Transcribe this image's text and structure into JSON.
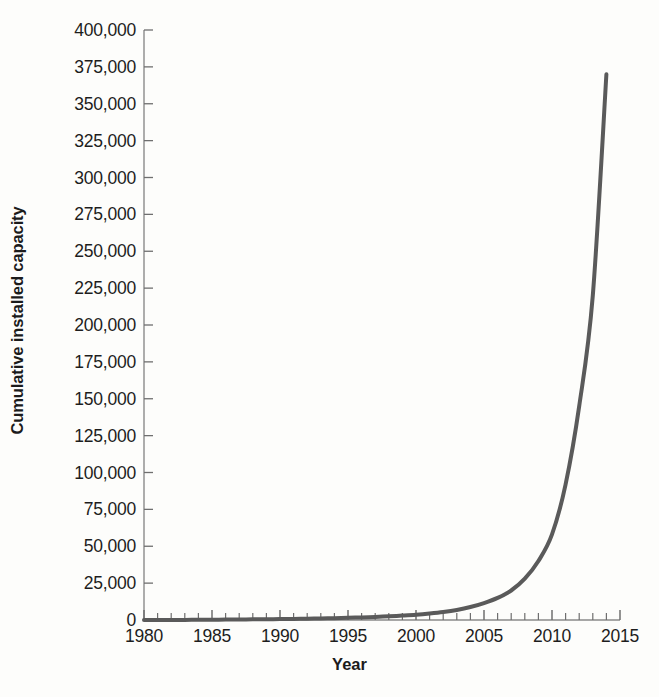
{
  "chart_data": {
    "type": "line",
    "title": "",
    "subtitle": "",
    "xlabel": "Year",
    "ylabel": "Cumulative installed capacity",
    "xlim": [
      1980,
      2015
    ],
    "ylim": [
      0,
      400000
    ],
    "grid": false,
    "legend": null,
    "legend_position": "none",
    "x_tick_labels": [
      "1980",
      "1985",
      "1990",
      "1995",
      "2000",
      "2005",
      "2010",
      "2015"
    ],
    "x_tick_values": [
      1980,
      1985,
      1990,
      1995,
      2000,
      2005,
      2010,
      2015
    ],
    "x_minor_tick_interval": 1,
    "y_tick_labels": [
      "400,000",
      "375,000",
      "350,000",
      "325,000",
      "300,000",
      "275,000",
      "250,000",
      "225,000",
      "200,000",
      "175,000",
      "150,000",
      "125,000",
      "100,000",
      "75,000",
      "50,000",
      "25,000",
      "0"
    ],
    "y_tick_values": [
      400000,
      375000,
      350000,
      325000,
      300000,
      275000,
      250000,
      225000,
      200000,
      175000,
      150000,
      125000,
      100000,
      75000,
      50000,
      25000,
      0
    ],
    "series": [
      {
        "name": "Cumulative installed capacity",
        "color": "#5a5a5a",
        "line_width": 4,
        "x": [
          1980,
          1981,
          1982,
          1983,
          1984,
          1985,
          1986,
          1987,
          1988,
          1989,
          1990,
          1991,
          1992,
          1993,
          1994,
          1995,
          1996,
          1997,
          1998,
          1999,
          2000,
          2001,
          2002,
          2003,
          2004,
          2005,
          2006,
          2007,
          2008,
          2009,
          2010,
          2011,
          2012,
          2013,
          2014
        ],
        "values": [
          0,
          20,
          45,
          80,
          130,
          190,
          260,
          340,
          430,
          530,
          640,
          760,
          900,
          1060,
          1250,
          1480,
          1760,
          2100,
          2500,
          3000,
          3600,
          4400,
          5400,
          6800,
          8800,
          11500,
          15000,
          20000,
          28000,
          40000,
          58000,
          92000,
          145000,
          220000,
          370000
        ]
      }
    ],
    "annotations": []
  },
  "axis": {
    "line_color": "#8a8a8a",
    "tick_color": "#6f6f6f",
    "text_color": "#1d1d1d"
  },
  "background_color": "#fdfdfb"
}
